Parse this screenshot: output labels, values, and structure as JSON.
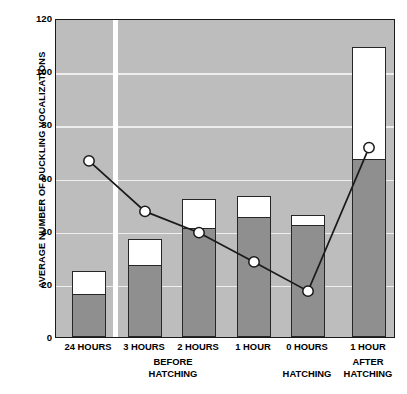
{
  "chart_data": {
    "type": "bar",
    "title": "",
    "subtitle": "",
    "xlabel": "",
    "ylabel": "AVERAGE NUMBER OF DUCKLING VOCALIZATIONS",
    "ylim": [
      0,
      120
    ],
    "yticks": [
      0,
      20,
      40,
      60,
      80,
      100,
      120
    ],
    "ytick_labels": [
      "0",
      "20",
      "40",
      "60",
      "80",
      "100",
      "120"
    ],
    "grid": true,
    "grid_axis": "y",
    "legend": "none",
    "categories": [
      "24 HOURS",
      "3 HOURS",
      "2 HOURS",
      "1 HOUR",
      "0 HOURS",
      "1 HOUR"
    ],
    "groups": [
      {
        "label_line1": "BEFORE",
        "label_line2": "HATCHING",
        "categories": [
          "24 HOURS",
          "3 HOURS",
          "2 HOURS",
          "1 HOUR"
        ]
      },
      {
        "label_line1": "",
        "label_line2": "HATCHING",
        "categories": [
          "0 HOURS"
        ]
      },
      {
        "label_line1": "AFTER",
        "label_line2": "HATCHING",
        "categories": [
          "1 HOUR"
        ]
      }
    ],
    "series": [
      {
        "name": "Total vocalizations",
        "style": "bar-outline-white",
        "color": "#ffffff",
        "values": [
          25,
          37,
          52,
          53,
          46,
          109
        ]
      },
      {
        "name": "Vocalizations (shaded portion)",
        "style": "bar-fill-gray",
        "color": "#8f8f8f",
        "values": [
          16,
          27,
          41,
          45,
          42,
          67
        ]
      },
      {
        "name": "Line with circle markers",
        "style": "line-marker-circle",
        "color": "#1a1a1a",
        "marker_facecolor": "#ffffff",
        "values": [
          67,
          48,
          40,
          29,
          18,
          72
        ]
      }
    ],
    "axis_break_after_category": "24 HOURS",
    "plot_background": "#bdbdbd",
    "axis_color": "#1a1a1a"
  },
  "axis": {
    "y_title": "AVERAGE NUMBER OF DUCKLING VOCALIZATIONS"
  }
}
